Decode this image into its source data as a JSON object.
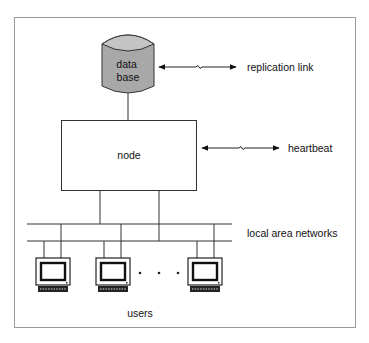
{
  "diagram": {
    "database_label_line1": "data",
    "database_label_line2": "base",
    "node_label": "node",
    "replication_label": "replication link",
    "heartbeat_label": "heartbeat",
    "lan_label": "local area networks",
    "users_label": "users",
    "ellipsis": "· · ·"
  },
  "colors": {
    "frame": "#9a9a9a",
    "line": "#333333",
    "database_fill": "#a8a8a8",
    "database_top_fill": "#c4c4c4"
  },
  "users": [
    {
      "name": "user-1"
    },
    {
      "name": "user-2"
    },
    {
      "name": "user-n"
    }
  ]
}
